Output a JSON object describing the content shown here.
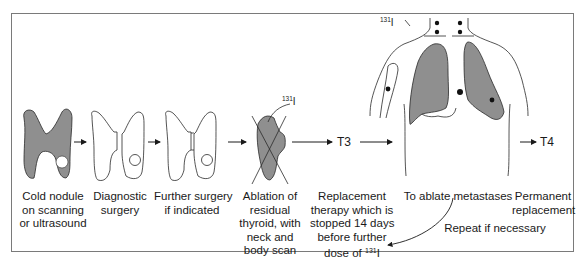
{
  "diagram": {
    "steps": [
      {
        "id": "cold-nodule",
        "lines": [
          "Cold nodule",
          "on scanning",
          "or ultrasound"
        ]
      },
      {
        "id": "diagnostic-surgery",
        "lines": [
          "Diagnostic",
          "surgery"
        ]
      },
      {
        "id": "further-surgery",
        "lines": [
          "Further surgery",
          "if indicated"
        ]
      },
      {
        "id": "ablation",
        "lines": [
          "Ablation of",
          "residual",
          "thyroid, with",
          "neck and",
          "body scan"
        ]
      },
      {
        "id": "replacement-therapy",
        "lines": [
          "Replacement",
          "therapy which is",
          "stopped 14 days",
          "before further",
          "dose of"
        ]
      },
      {
        "id": "ablate-metastases",
        "lines": [
          "To ablate metastases"
        ]
      },
      {
        "id": "permanent-replacement",
        "lines": [
          "Permanent",
          "replacement"
        ]
      }
    ],
    "isotope": {
      "mass": "131",
      "element": "I"
    },
    "arrow_labels": {
      "t3": "T3",
      "t4": "T4"
    },
    "loop_label": "Repeat if necessary",
    "colors": {
      "tissue": "#8f8f8f",
      "outline": "#2a2a2a",
      "frame": "#7a7a7a"
    }
  }
}
